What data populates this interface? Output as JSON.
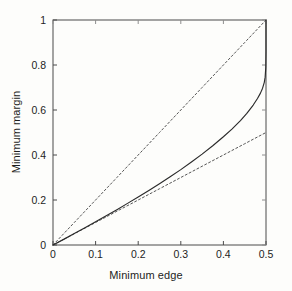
{
  "chart_data": {
    "type": "line",
    "title": "",
    "xlabel": "Minimum edge",
    "ylabel": "Minimum margin",
    "xlim": [
      0,
      0.5
    ],
    "ylim": [
      0,
      1
    ],
    "xticks": [
      "0",
      "0.1",
      "0.2",
      "0.3",
      "0.4",
      "0.5"
    ],
    "xtick_values": [
      0,
      0.1,
      0.2,
      0.3,
      0.4,
      0.5
    ],
    "yticks": [
      "0",
      "0.2",
      "0.4",
      "0.6",
      "0.8",
      "1"
    ],
    "ytick_values": [
      0,
      0.2,
      0.4,
      0.6,
      0.8,
      1
    ],
    "grid": false,
    "legend": "none",
    "frame": "box",
    "tick_direction": "in",
    "series": [
      {
        "name": "upper-bound-dashed",
        "style": "dashed",
        "color": "#555555",
        "x": [
          0,
          0.05,
          0.1,
          0.15,
          0.2,
          0.25,
          0.3,
          0.35,
          0.4,
          0.45,
          0.5
        ],
        "values": [
          0,
          0.1,
          0.2,
          0.3,
          0.4,
          0.5,
          0.6,
          0.7,
          0.8,
          0.9,
          1.0
        ]
      },
      {
        "name": "lower-bound-dashed",
        "style": "dashed",
        "color": "#555555",
        "x": [
          0,
          0.05,
          0.1,
          0.15,
          0.2,
          0.25,
          0.3,
          0.35,
          0.4,
          0.45,
          0.5
        ],
        "values": [
          0,
          0.05,
          0.1,
          0.15,
          0.2,
          0.25,
          0.3,
          0.35,
          0.4,
          0.45,
          0.5
        ]
      },
      {
        "name": "minimum-margin-curve",
        "style": "solid",
        "color": "#2a2a2a",
        "x": [
          0,
          0.025,
          0.05,
          0.075,
          0.1,
          0.125,
          0.15,
          0.175,
          0.2,
          0.225,
          0.25,
          0.275,
          0.3,
          0.325,
          0.35,
          0.375,
          0.4,
          0.42,
          0.44,
          0.455,
          0.47,
          0.48,
          0.487,
          0.492,
          0.496,
          0.498,
          0.4995,
          0.5,
          0.5
        ],
        "values": [
          0,
          0.025,
          0.051,
          0.077,
          0.103,
          0.13,
          0.157,
          0.185,
          0.213,
          0.242,
          0.272,
          0.303,
          0.335,
          0.369,
          0.404,
          0.441,
          0.481,
          0.515,
          0.553,
          0.585,
          0.622,
          0.651,
          0.675,
          0.697,
          0.723,
          0.746,
          0.79,
          0.86,
          1.0
        ]
      }
    ]
  },
  "axes": {
    "x_label": "Minimum edge",
    "y_label": "Minimum margin"
  }
}
